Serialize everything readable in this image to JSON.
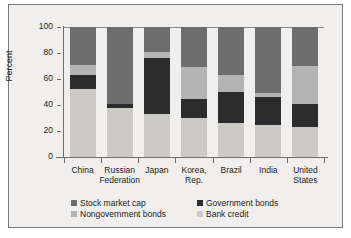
{
  "chart_data": {
    "type": "bar",
    "stacked": true,
    "title": "",
    "xlabel": "",
    "ylabel": "Percent",
    "ylim": [
      0,
      100
    ],
    "yticks": [
      0,
      20,
      40,
      60,
      80,
      100
    ],
    "grid": false,
    "legend_position": "bottom",
    "categories": [
      "China",
      "Russian Federation",
      "Japan",
      "Korea, Rep.",
      "Brazil",
      "India",
      "United States"
    ],
    "category_lines": [
      [
        "China"
      ],
      [
        "Russian",
        "Federation"
      ],
      [
        "Japan"
      ],
      [
        "Korea,",
        "Rep."
      ],
      [
        "Brazil"
      ],
      [
        "India"
      ],
      [
        "United",
        "States"
      ]
    ],
    "series": [
      {
        "name": "Bank credit",
        "color": "#cccac6",
        "values": [
          52,
          38,
          33,
          30,
          26,
          25,
          23
        ]
      },
      {
        "name": "Government bonds",
        "color": "#2c2c2c",
        "values": [
          11,
          3,
          43,
          15,
          24,
          21,
          18
        ]
      },
      {
        "name": "Nongovernment bonds",
        "color": "#b4b4b4",
        "values": [
          8,
          0,
          5,
          24,
          13,
          3,
          29
        ]
      },
      {
        "name": "Stock market cap",
        "color": "#6d6d6d",
        "values": [
          29,
          59,
          19,
          31,
          37,
          51,
          30
        ]
      }
    ],
    "legend_order": [
      "Stock market cap",
      "Government bonds",
      "Nongovernment bonds",
      "Bank credit"
    ]
  },
  "axis": {
    "y_label": "Percent",
    "y_tick_100": "100",
    "y_tick_80": "80",
    "y_tick_60": "60",
    "y_tick_40": "40",
    "y_tick_20": "20",
    "y_tick_0": "0"
  },
  "legend": {
    "stock_market_cap": "Stock market cap",
    "government_bonds": "Government bonds",
    "nongovernment_bonds": "Nongovernment bonds",
    "bank_credit": "Bank credit"
  },
  "x_labels": {
    "china_l1": "China",
    "china_l2": "",
    "russia_l1": "Russian",
    "russia_l2": "Federation",
    "japan_l1": "Japan",
    "japan_l2": "",
    "korea_l1": "Korea,",
    "korea_l2": "Rep.",
    "brazil_l1": "Brazil",
    "brazil_l2": "",
    "india_l1": "India",
    "india_l2": "",
    "us_l1": "United",
    "us_l2": "States"
  },
  "colors": {
    "stock_market_cap": "#6d6d6d",
    "government_bonds": "#2c2c2c",
    "nongovernment_bonds": "#b4b4b4",
    "bank_credit": "#cccac6",
    "panel_background": "#f0efed",
    "axis": "#6d6d6d",
    "text": "#1c1c1c"
  }
}
